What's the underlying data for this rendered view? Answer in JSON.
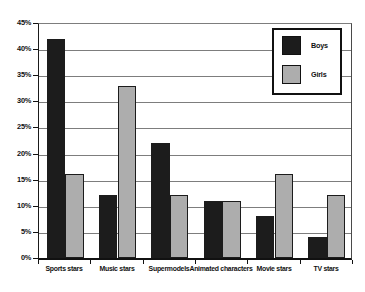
{
  "chart_data": {
    "type": "bar",
    "title": "",
    "xlabel": "",
    "ylabel": "",
    "categories": [
      "Sports stars",
      "Music stars",
      "Supermodels",
      "Animated characters",
      "Movie stars",
      "TV stars"
    ],
    "series": [
      {
        "name": "Boys",
        "color": "#1c1c1c",
        "values": [
          42,
          12,
          22,
          11,
          8,
          4
        ]
      },
      {
        "name": "Girls",
        "color": "#adadad",
        "values": [
          16,
          33,
          12,
          11,
          16,
          12
        ]
      }
    ],
    "ymin": 0,
    "ymax": 45,
    "ytick_step": 5,
    "yticks": [
      "0%",
      "5%",
      "10%",
      "15%",
      "20%",
      "25%",
      "30%",
      "35%",
      "40%",
      "45%"
    ],
    "grid": true,
    "legend_position": "top-right",
    "legend_entries": [
      "Boys",
      "Girls"
    ]
  },
  "colors": {
    "background": "#ffffff",
    "gridline": "#7d7d7d",
    "axis": "#111111",
    "text": "#111111",
    "boys_bar": "#1c1c1c",
    "girls_bar": "#adadad"
  }
}
